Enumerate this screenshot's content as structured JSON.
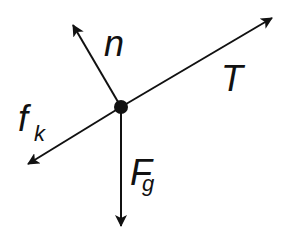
{
  "diagram": {
    "type": "free-body-diagram",
    "center": {
      "x": 121,
      "y": 107,
      "r": 7
    },
    "colors": {
      "stroke": "#111111",
      "background": "#ffffff"
    },
    "forces": [
      {
        "id": "normal",
        "label": "n",
        "subscript": "",
        "tip": {
          "x": 72,
          "y": 23
        }
      },
      {
        "id": "tension",
        "label": "T",
        "subscript": "",
        "tip": {
          "x": 274,
          "y": 17
        }
      },
      {
        "id": "kinetic-friction",
        "label": "f",
        "subscript": "k",
        "tip": {
          "x": 26,
          "y": 165
        }
      },
      {
        "id": "gravity",
        "label": "F",
        "subscript": "g",
        "tip": {
          "x": 121,
          "y": 228
        }
      }
    ]
  }
}
